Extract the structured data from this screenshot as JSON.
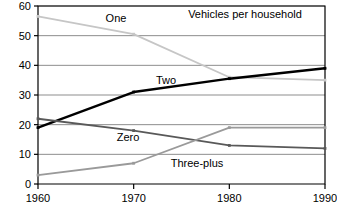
{
  "chart_data": {
    "type": "line",
    "title": "Vehicles per household",
    "xlabel": "",
    "ylabel": "",
    "x": [
      1960,
      1970,
      1980,
      1990
    ],
    "categories": [
      "1960",
      "1970",
      "1980",
      "1990"
    ],
    "xtick_labels": [
      "1960",
      "1970",
      "1980",
      "1990"
    ],
    "ytick_labels": [
      "0",
      "10",
      "20",
      "30",
      "40",
      "50",
      "60"
    ],
    "ytick_values": [
      0,
      10,
      20,
      30,
      40,
      50,
      60
    ],
    "ylim": [
      0,
      60
    ],
    "xlim": [
      1960,
      1990
    ],
    "grid": "horizontal",
    "legend": "inline-labels",
    "series": [
      {
        "name": "One",
        "label": "One",
        "color": "#c6c6c6",
        "values": [
          56.5,
          50.5,
          36.0,
          35.0
        ]
      },
      {
        "name": "Two",
        "label": "Two",
        "color": "#000000",
        "values": [
          19.0,
          31.0,
          35.5,
          39.0
        ]
      },
      {
        "name": "Zero",
        "label": "Zero",
        "color": "#595959",
        "values": [
          22.0,
          18.0,
          13.0,
          12.0
        ]
      },
      {
        "name": "Three-plus",
        "label": "Three-plus",
        "color": "#9a9a9a",
        "values": [
          3.0,
          7.0,
          19.0,
          19.0
        ]
      }
    ],
    "series_label_positions": [
      {
        "name": "One",
        "x": 116,
        "y": 22
      },
      {
        "name": "Two",
        "x": 166,
        "y": 84
      },
      {
        "name": "Zero",
        "x": 128,
        "y": 141
      },
      {
        "name": "Three-plus",
        "x": 197,
        "y": 167
      }
    ],
    "title_position": {
      "x": 245,
      "y": 18
    }
  },
  "axes": {
    "y_axis_name": "y-axis",
    "x_axis_name": "x-axis"
  }
}
